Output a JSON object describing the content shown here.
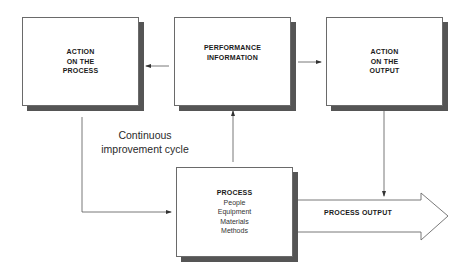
{
  "diagram": {
    "boxes": {
      "action_on_process": {
        "label": "ACTION\nON THE\nPROCESS"
      },
      "performance_information": {
        "label": "PERFORMANCE\nINFORMATION"
      },
      "action_on_output": {
        "label": "ACTION\nON THE\nOUTPUT"
      },
      "process": {
        "title": "PROCESS",
        "items": [
          "People",
          "Equipment",
          "Materials",
          "Methods"
        ]
      }
    },
    "process_output": {
      "label": "PROCESS OUTPUT"
    },
    "cycle_label": {
      "line1": "Continuous",
      "line2": "improvement cycle"
    },
    "colors": {
      "line": "#555555",
      "shadow": "#555555",
      "border": "#6a6a6a"
    }
  }
}
